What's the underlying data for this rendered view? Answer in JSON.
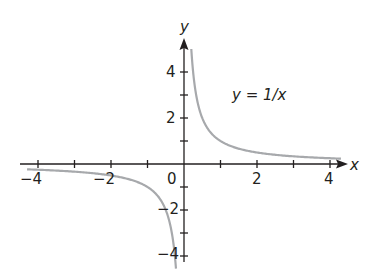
{
  "chart_data": {
    "type": "line",
    "title": "",
    "annotation": "y = 1/x",
    "xlabel": "x",
    "ylabel": "y",
    "xlim": [
      -4.3,
      4.3
    ],
    "ylim": [
      -4.5,
      5
    ],
    "x_ticks": [
      -4,
      -3,
      -2,
      -1,
      0,
      1,
      2,
      3,
      4
    ],
    "x_tick_labels": [
      "-4",
      "-2",
      "0",
      "2",
      "4"
    ],
    "y_ticks": [
      -4,
      -3,
      -2,
      -1,
      1,
      2,
      3,
      4
    ],
    "y_tick_labels": [
      "4",
      "2",
      "-2",
      "-4"
    ],
    "grid": false,
    "series": [
      {
        "name": "y = 1/x (x>0)",
        "x": [
          0.2,
          0.25,
          0.33,
          0.5,
          0.75,
          1,
          1.5,
          2,
          3,
          4,
          4.3
        ],
        "y": [
          5,
          4,
          3,
          2,
          1.33,
          1,
          0.67,
          0.5,
          0.33,
          0.25,
          0.23
        ]
      },
      {
        "name": "y = 1/x (x<0)",
        "x": [
          -4.3,
          -4,
          -3,
          -2,
          -1.5,
          -1,
          -0.75,
          -0.5,
          -0.33,
          -0.25,
          -0.22
        ],
        "y": [
          -0.23,
          -0.25,
          -0.33,
          -0.5,
          -0.67,
          -1,
          -1.33,
          -2,
          -3,
          -4,
          -4.5
        ]
      }
    ],
    "colors": {
      "axis": "#231f20",
      "curve": "#a7a9ac"
    }
  },
  "labels": {
    "x_axis": "x",
    "y_axis": "y",
    "equation": "y = 1/x",
    "x_m4": "−4",
    "x_m2": "−2",
    "origin": "0",
    "x_2": "2",
    "x_4": "4",
    "y_4": "4",
    "y_2": "2",
    "y_m2": "−2",
    "y_m4": "−4"
  }
}
